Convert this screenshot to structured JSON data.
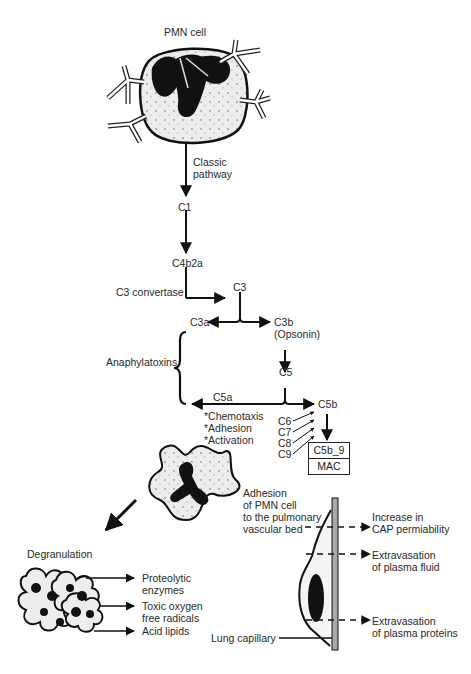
{
  "diagram": {
    "cell_title": "PMN cell",
    "pathway": {
      "classic_label_line1": "Classic",
      "classic_label_line2": "pathway",
      "c1": "C1",
      "c4b2a": "C4b2a",
      "c3_convertase": "C3 convertase",
      "c3": "C3",
      "c3a": "C3a",
      "c3b": "C3b",
      "c3b_note": "(Opsonin)",
      "anaphylatoxins": "Anaphylatoxins",
      "c5": "C5",
      "c5a": "C5a",
      "c5b": "C5b",
      "effects": [
        "*Chemotaxis",
        "*Adhesion",
        "*Activation"
      ],
      "late_components": [
        "C6",
        "C7",
        "C8",
        "C9"
      ],
      "complex_box": [
        "C5b_9",
        "MAC"
      ]
    },
    "degranulation": {
      "label": "Degranulation",
      "products": [
        [
          "Proteolytic",
          "enzymes"
        ],
        [
          "Toxic oxygen",
          "free radicals"
        ],
        [
          "Acid lipids"
        ]
      ]
    },
    "capillary": {
      "adhesion_label": [
        "Adhesion",
        "of PMN cell",
        "to the pulmonary",
        "vascular bed"
      ],
      "outcomes": [
        [
          "Increase in",
          "CAP permiability"
        ],
        [
          "Extravasation",
          "of plasma fluid"
        ],
        [
          "Extravasation",
          "of plasma proteins"
        ]
      ],
      "lung_capillary": "Lung capillary"
    }
  }
}
